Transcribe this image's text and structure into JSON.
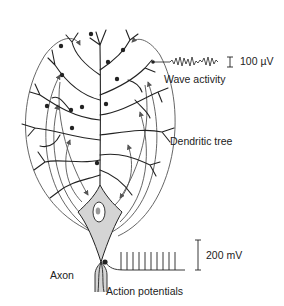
{
  "diagram": {
    "type": "neuron-schematic",
    "labels": {
      "wave_activity": "Wave activity",
      "wave_scale": "100 µV",
      "dendritic_tree": "Dendritic tree",
      "axon": "Axon",
      "action_potentials": "Action potentials",
      "ap_scale": "200 mV"
    },
    "colors": {
      "line": "#222222",
      "soma_fill": "#d4d4d4",
      "arrow": "#555555",
      "background": "#ffffff"
    },
    "spike_count": 10
  }
}
